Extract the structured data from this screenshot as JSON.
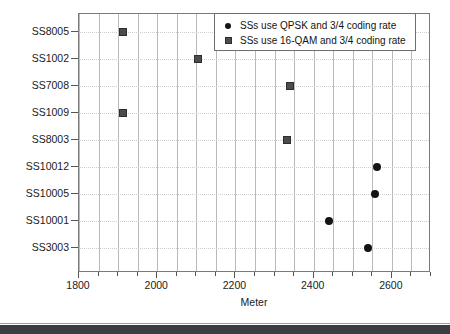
{
  "chart_data": {
    "type": "scatter",
    "title": "",
    "xlabel": "Meter",
    "ylabel": "",
    "xlim": [
      1800,
      2700
    ],
    "ylim_categories": [
      "SS8005",
      "SS1002",
      "SS7008",
      "SS1009",
      "SS8003",
      "SS10012",
      "SS10005",
      "SS10001",
      "SS3003"
    ],
    "x_ticks_major": [
      1800,
      2000,
      2200,
      2400,
      2600
    ],
    "x_tick_labels": [
      "1800",
      "2000",
      "2200",
      "2400",
      "2600"
    ],
    "x_tick_minor_step": 50,
    "grid": {
      "vertical": true,
      "horizontal": "dotted"
    },
    "legend_position": "top-right",
    "categories": [
      "SS8005",
      "SS1002",
      "SS7008",
      "SS1009",
      "SS8003",
      "SS10012",
      "SS10005",
      "SS10001",
      "SS3003"
    ],
    "series": [
      {
        "name": "SSs use QPSK and 3/4 coding rate",
        "marker": "circle",
        "color": "#141414",
        "points": [
          {
            "category": "SS10012",
            "x": 2561
          },
          {
            "category": "SS10005",
            "x": 2556
          },
          {
            "category": "SS10001",
            "x": 2440
          },
          {
            "category": "SS3003",
            "x": 2540
          }
        ]
      },
      {
        "name": "SSs use 16-QAM and 3/4 coding rate",
        "marker": "square",
        "color": "#4c4c4c",
        "points": [
          {
            "category": "SS8005",
            "x": 1912
          },
          {
            "category": "SS1002",
            "x": 2105
          },
          {
            "category": "SS7008",
            "x": 2340
          },
          {
            "category": "SS1009",
            "x": 1912
          },
          {
            "category": "SS8003",
            "x": 2333
          }
        ]
      }
    ]
  },
  "legend": {
    "items": [
      {
        "label": "SSs use QPSK and 3/4 coding rate",
        "marker": "circle-marker"
      },
      {
        "label": "SSs use 16-QAM and 3/4 coding rate",
        "marker": "square-marker"
      }
    ]
  },
  "axis": {
    "x_title": "Meter"
  }
}
